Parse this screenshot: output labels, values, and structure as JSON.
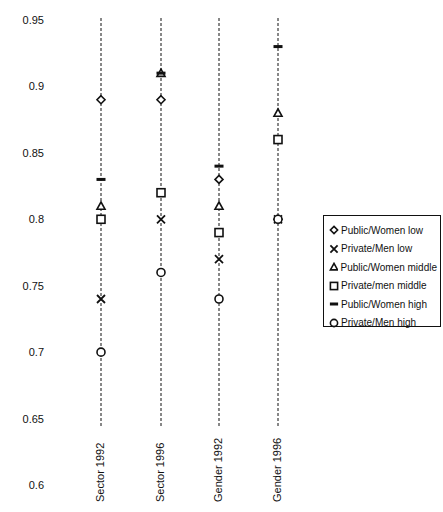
{
  "header": {
    "partial_title": ""
  },
  "chart_data": {
    "type": "scatter",
    "title": "",
    "xlabel": "",
    "ylabel": "",
    "ylim": [
      0.6,
      0.95
    ],
    "yticks": [
      "0.95",
      "0.9",
      "0.85",
      "0.8",
      "0.75",
      "0.7",
      "0.65",
      "0.6"
    ],
    "categories": [
      "Sector 1992",
      "Sector 1996",
      "Gender 1992",
      "Gender 1996"
    ],
    "grid": "vertical dashed lines per category",
    "legend_position": "right",
    "series": [
      {
        "name": "Public/Women low",
        "marker": "diamond",
        "values": [
          0.89,
          0.89,
          0.83,
          0.8
        ]
      },
      {
        "name": "Private/Men low",
        "marker": "x",
        "values": [
          0.74,
          0.8,
          0.77,
          0.8
        ]
      },
      {
        "name": "Public/Women middle",
        "marker": "triangle",
        "values": [
          0.81,
          0.91,
          0.81,
          0.88
        ]
      },
      {
        "name": "Private/men middle",
        "marker": "square",
        "values": [
          0.8,
          0.82,
          0.79,
          0.86
        ]
      },
      {
        "name": "Public/Women high",
        "marker": "dash",
        "values": [
          0.83,
          0.91,
          0.84,
          0.93
        ]
      },
      {
        "name": "Private/Men high",
        "marker": "circle",
        "values": [
          0.7,
          0.76,
          0.74,
          0.8
        ]
      }
    ]
  },
  "legend": {
    "items": [
      {
        "label": "Public/Women low",
        "marker": "diamond"
      },
      {
        "label": "Private/Men low",
        "marker": "x"
      },
      {
        "label": "Public/Women middle",
        "marker": "triangle"
      },
      {
        "label": "Private/men middle",
        "marker": "square"
      },
      {
        "label": "Public/Women high",
        "marker": "dash"
      },
      {
        "label": "Private/Men high",
        "marker": "circle"
      }
    ]
  },
  "colors": {
    "ink": "#111111",
    "background": "#ffffff"
  }
}
